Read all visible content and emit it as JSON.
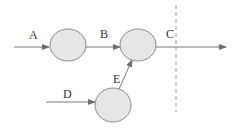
{
  "diagram": {
    "type": "flow-diagram",
    "nodes": [
      {
        "id": "node-1",
        "cx": 68,
        "cy": 45,
        "rx": 18,
        "ry": 16
      },
      {
        "id": "node-2",
        "cx": 138,
        "cy": 45,
        "rx": 18,
        "ry": 16
      },
      {
        "id": "node-3",
        "cx": 113,
        "cy": 105,
        "rx": 18,
        "ry": 17
      }
    ],
    "edges": [
      {
        "label": "A",
        "from": "input",
        "to": "node-1"
      },
      {
        "label": "B",
        "from": "node-1",
        "to": "node-2"
      },
      {
        "label": "C",
        "from": "node-2",
        "to": "output"
      },
      {
        "label": "D",
        "from": "input",
        "to": "node-3"
      },
      {
        "label": "E",
        "from": "node-3",
        "to": "node-2"
      }
    ],
    "labels": {
      "a": "A",
      "b": "B",
      "c": "C",
      "d": "D",
      "e": "E"
    },
    "boundary": {
      "style": "dashed",
      "x": 176
    }
  }
}
